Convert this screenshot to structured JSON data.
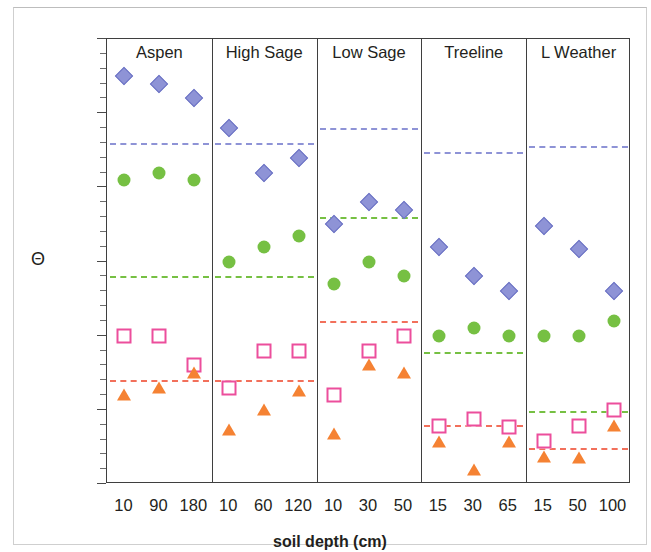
{
  "chart_data": {
    "type": "scatter",
    "title": "",
    "xlabel": "soil depth (cm)",
    "ylabel": "Θ",
    "ylim": [
      0,
      0.6
    ],
    "y_major_ticks": [
      "0.6",
      "0.5",
      "0.4",
      "0.3",
      "0.2",
      "0.1",
      "0"
    ],
    "y_major_values": [
      0.6,
      0.5,
      0.4,
      0.3,
      0.2,
      0.1,
      0
    ],
    "y_minor_values": [
      0.58,
      0.56,
      0.54,
      0.52,
      0.48,
      0.46,
      0.44,
      0.42,
      0.38,
      0.36,
      0.34,
      0.32,
      0.28,
      0.26,
      0.24,
      0.22,
      0.18,
      0.16,
      0.14,
      0.12,
      0.08,
      0.06,
      0.04,
      0.02
    ],
    "grid": false,
    "legend": "none",
    "series": [
      {
        "name": "series-diamond",
        "marker": "diamond",
        "color": "#8e93d6"
      },
      {
        "name": "series-circle",
        "marker": "circle",
        "color": "#76c043"
      },
      {
        "name": "series-square",
        "marker": "square",
        "color": "#ec4e9c"
      },
      {
        "name": "series-triangle",
        "marker": "triangle",
        "color": "#f58233"
      }
    ],
    "panels": [
      {
        "label": "Aspen",
        "categories": [
          "10",
          "90",
          "180"
        ],
        "diamond": [
          0.55,
          0.54,
          0.52
        ],
        "circle": [
          0.41,
          0.42,
          0.41
        ],
        "square": [
          0.2,
          0.2,
          0.16
        ],
        "triangle": [
          0.12,
          0.13,
          0.15
        ],
        "ref_diamond": 0.46,
        "ref_circle": 0.28,
        "ref_triangle": 0.14
      },
      {
        "label": "High Sage",
        "categories": [
          "10",
          "60",
          "120"
        ],
        "diamond": [
          0.48,
          0.42,
          0.44
        ],
        "circle": [
          0.3,
          0.32,
          0.335
        ],
        "square": [
          0.13,
          0.18,
          0.18
        ],
        "triangle": [
          0.073,
          0.1,
          0.125
        ],
        "ref_diamond": 0.46,
        "ref_circle": 0.28,
        "ref_triangle": 0.14
      },
      {
        "label": "Low Sage",
        "categories": [
          "10",
          "30",
          "50"
        ],
        "diamond": [
          0.35,
          0.38,
          0.37
        ],
        "circle": [
          0.27,
          0.3,
          0.28
        ],
        "square": [
          0.12,
          0.18,
          0.2
        ],
        "triangle": [
          0.068,
          0.16,
          0.15
        ],
        "ref_diamond": 0.48,
        "ref_circle": 0.36,
        "ref_triangle": 0.22
      },
      {
        "label": "Treeline",
        "categories": [
          "15",
          "30",
          "65"
        ],
        "diamond": [
          0.32,
          0.28,
          0.26
        ],
        "circle": [
          0.2,
          0.21,
          0.2
        ],
        "square": [
          0.078,
          0.088,
          0.077
        ],
        "triangle": [
          0.057,
          0.019,
          0.056
        ],
        "ref_diamond": 0.447,
        "ref_circle": 0.178,
        "ref_triangle": 0.079
      },
      {
        "label": "L Weather",
        "categories": [
          "15",
          "50",
          "100"
        ],
        "diamond": [
          0.348,
          0.317,
          0.26
        ],
        "circle": [
          0.2,
          0.2,
          0.22
        ],
        "square": [
          0.058,
          0.078,
          0.1
        ],
        "triangle": [
          0.037,
          0.035,
          0.078
        ],
        "ref_diamond": 0.456,
        "ref_circle": 0.098,
        "ref_triangle": 0.048
      }
    ]
  },
  "colors": {
    "diamond": "#8e93d6",
    "circle": "#76c043",
    "square": "#ec4e9c",
    "triangle": "#f58233",
    "axis": "#3f3f3f",
    "text": "#231f20"
  }
}
